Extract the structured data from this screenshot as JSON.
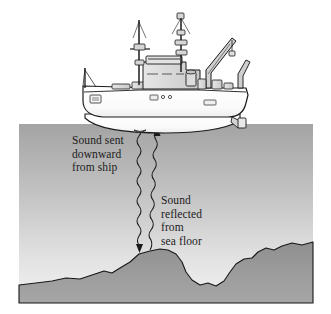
{
  "figure": {
    "background_color": "#ffffff"
  },
  "labels": {
    "sound_sent": "Sound sent\ndownward\nfrom ship",
    "sound_reflected": "Sound\nreflected\nfrom\nsea floor"
  },
  "colors": {
    "water_top": "#a9a9a9",
    "water_bottom": "#efefef",
    "seafloor": "#9a9a9a",
    "outline": "#1b1b1b",
    "hull_fill": "#ffffff",
    "superstructure_fill": "#d8d8d8",
    "text": "#1b1b1b"
  },
  "scene": {
    "water_rect": {
      "x": 19,
      "y": 124,
      "width": 294,
      "height": 179
    },
    "waterline_y": 124,
    "ship": {
      "name": "research-vessel",
      "bow_x": 82,
      "stern_x": 248,
      "deck_y": 100,
      "masts": 2,
      "crane": "stern-derrick",
      "a_frame": "stern-a-frame",
      "hull_marking": "26"
    },
    "rays": [
      {
        "name": "outgoing-sound-ray",
        "direction": "downward",
        "from_x": 140,
        "from_y": 126,
        "to_x": 139,
        "to_y": 252,
        "arrow": "bottom"
      },
      {
        "name": "reflected-sound-ray",
        "direction": "upward",
        "from_x": 150,
        "from_y": 250,
        "to_x": 157,
        "to_y": 127,
        "arrow": "top"
      }
    ],
    "seafloor_profile_points": [
      [
        19,
        285
      ],
      [
        36,
        283
      ],
      [
        52,
        281
      ],
      [
        66,
        278
      ],
      [
        80,
        279
      ],
      [
        92,
        275
      ],
      [
        104,
        271
      ],
      [
        112,
        273
      ],
      [
        120,
        268
      ],
      [
        130,
        262
      ],
      [
        139,
        254
      ],
      [
        150,
        251
      ],
      [
        160,
        249
      ],
      [
        168,
        250
      ],
      [
        176,
        254
      ],
      [
        182,
        262
      ],
      [
        186,
        272
      ],
      [
        192,
        280
      ],
      [
        200,
        285
      ],
      [
        208,
        283
      ],
      [
        216,
        286
      ],
      [
        224,
        281
      ],
      [
        230,
        272
      ],
      [
        236,
        264
      ],
      [
        244,
        259
      ],
      [
        252,
        258
      ],
      [
        258,
        252
      ],
      [
        266,
        248
      ],
      [
        274,
        250
      ],
      [
        282,
        246
      ],
      [
        292,
        243
      ],
      [
        302,
        245
      ],
      [
        313,
        242
      ]
    ]
  }
}
